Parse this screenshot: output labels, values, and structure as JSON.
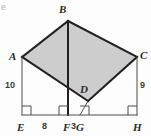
{
  "figure": {
    "corner_fragment": "e",
    "fill_color": "#cdcdcd",
    "stroke_color": "#231f20",
    "thin_stroke_color": "#4d4d4d",
    "background_color": "#fdfdfd"
  },
  "vertices": [
    {
      "name": "A",
      "label": "A",
      "x": 22,
      "y": 57,
      "label_x": 9,
      "label_y": 51
    },
    {
      "name": "B",
      "label": "B",
      "x": 68,
      "y": 21,
      "label_x": 59,
      "label_y": 4
    },
    {
      "name": "C",
      "label": "C",
      "x": 137,
      "y": 57,
      "label_x": 140,
      "label_y": 50
    },
    {
      "name": "D",
      "label": "D",
      "x": 88,
      "y": 101,
      "label_x": 80,
      "label_y": 84
    },
    {
      "name": "E",
      "label": "E",
      "x": 22,
      "y": 115,
      "label_x": 17,
      "label_y": 122
    },
    {
      "name": "F",
      "label": "F",
      "x": 68,
      "y": 115,
      "label_x": 63,
      "label_y": 122
    },
    {
      "name": "G",
      "label": "G",
      "x": 80,
      "y": 115,
      "label_x": 76,
      "label_y": 122
    },
    {
      "name": "H",
      "label": "H",
      "x": 137,
      "y": 115,
      "label_x": 133,
      "label_y": 122
    }
  ],
  "measures": [
    {
      "name": "AE",
      "value": "10",
      "x": 5,
      "y": 81
    },
    {
      "name": "CH",
      "value": "9",
      "x": 140,
      "y": 81
    },
    {
      "name": "EF",
      "value": "8",
      "x": 42,
      "y": 122
    },
    {
      "name": "FG",
      "value": "3",
      "x": 71,
      "y": 122
    }
  ],
  "shaded_polygon": {
    "name": "parallelogram-ABCD",
    "points": "22,57 68,21 137,57 88,101"
  },
  "segments": [
    {
      "name": "segment-AB",
      "x1": 22,
      "y1": 57,
      "x2": 68,
      "y2": 21,
      "weight": "thick"
    },
    {
      "name": "segment-BC",
      "x1": 68,
      "y1": 21,
      "x2": 137,
      "y2": 57,
      "weight": "thick"
    },
    {
      "name": "segment-CD",
      "x1": 137,
      "y1": 57,
      "x2": 88,
      "y2": 101,
      "weight": "thick"
    },
    {
      "name": "segment-DA",
      "x1": 88,
      "y1": 101,
      "x2": 22,
      "y2": 57,
      "weight": "thick"
    },
    {
      "name": "segment-BF-altitude",
      "x1": 68,
      "y1": 21,
      "x2": 68,
      "y2": 115,
      "weight": "thick"
    },
    {
      "name": "segment-AE",
      "x1": 22,
      "y1": 57,
      "x2": 22,
      "y2": 115,
      "weight": "thin"
    },
    {
      "name": "segment-CH",
      "x1": 137,
      "y1": 57,
      "x2": 137,
      "y2": 115,
      "weight": "thin"
    },
    {
      "name": "segment-DG",
      "x1": 88,
      "y1": 101,
      "x2": 80,
      "y2": 115,
      "weight": "thin"
    },
    {
      "name": "segment-EH-baseline",
      "x1": 22,
      "y1": 115,
      "x2": 137,
      "y2": 115,
      "weight": "thin"
    }
  ],
  "right_angle_marks": [
    {
      "name": "right-angle-E",
      "x": 22,
      "y": 115,
      "dir": 1
    },
    {
      "name": "right-angle-F",
      "x": 68,
      "y": 115,
      "dir": -1
    },
    {
      "name": "right-angle-G",
      "x": 80,
      "y": 115,
      "dir": 1
    },
    {
      "name": "right-angle-H",
      "x": 137,
      "y": 115,
      "dir": -1
    }
  ]
}
